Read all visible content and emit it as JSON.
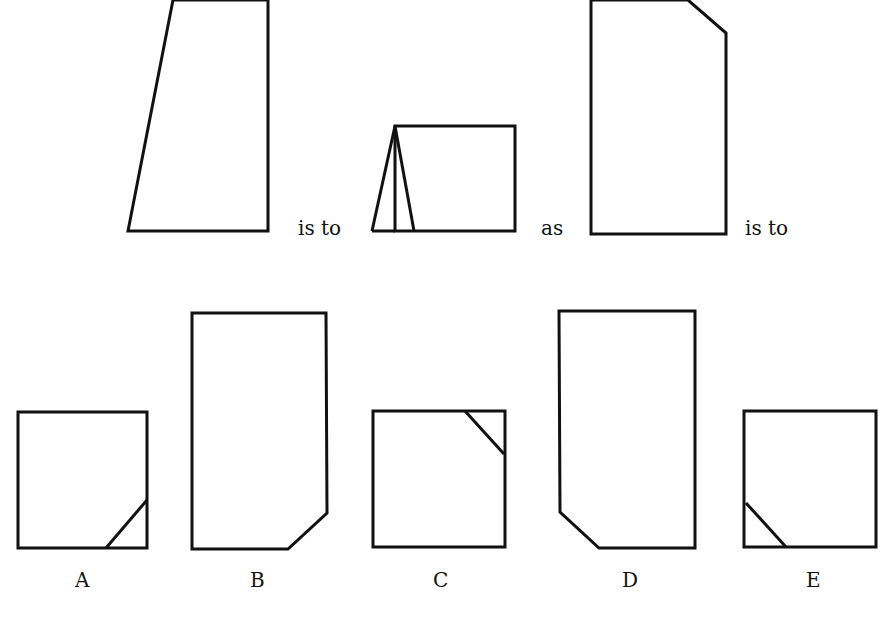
{
  "puzzle": {
    "type": "figure-analogy",
    "connectors": {
      "first": "is to",
      "second": "as",
      "third": "is to"
    },
    "stem_figures": [
      {
        "id": "figure-1",
        "description": "tall trapezoid with slanted left edge",
        "points": "173,0 268,0 268,231 128,231"
      },
      {
        "id": "figure-2",
        "description": "rectangle with thin triangle on left",
        "rect": "395,126 515,126 515,231 395,231",
        "extra_lines": [
          [
            395,
            126,
            372,
            231
          ],
          [
            372,
            231,
            395,
            231
          ],
          [
            395,
            126,
            414,
            231
          ]
        ]
      },
      {
        "id": "figure-3",
        "description": "tall rectangle with top-right corner cut",
        "points": "591,0 688,0 726,33 726,234 591,234"
      }
    ],
    "options": [
      {
        "label": "A",
        "description": "square with diagonal cutting bottom-right corner",
        "points": "18,412 147,412 147,548 18,548",
        "diagonal": [
          106,
          548,
          147,
          500
        ]
      },
      {
        "label": "B",
        "description": "tall rectangle with bottom-right corner cut",
        "points": "192,313 326,313 327,513 288,549 192,549"
      },
      {
        "label": "C",
        "description": "square with diagonal cutting top-right corner",
        "points": "373,411 505,411 505,547 373,547",
        "diagonal": [
          465,
          411,
          504,
          454
        ]
      },
      {
        "label": "D",
        "description": "tall rectangle with bottom-left corner cut",
        "points": "559,311 695,311 695,548 599,548 560,512"
      },
      {
        "label": "E",
        "description": "square with diagonal cutting bottom-left corner",
        "points": "744,411 876,411 876,547 744,547",
        "diagonal": [
          746,
          503,
          786,
          547
        ]
      }
    ]
  },
  "colors": {
    "stroke": "#111111",
    "background": "#ffffff"
  }
}
